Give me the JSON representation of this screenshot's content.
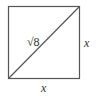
{
  "diagram": {
    "shape": "square",
    "diagonal_label": "√8",
    "side_right_label": "x",
    "side_bottom_label": "x",
    "stroke_color": "#555555"
  }
}
